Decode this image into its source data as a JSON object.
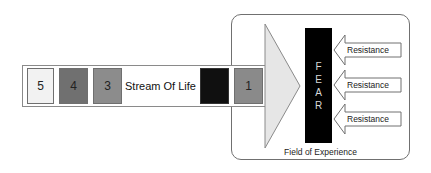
{
  "diagram": {
    "stream": {
      "label": "Stream Of Life",
      "segments": [
        {
          "label": "5",
          "fill": "#f2f2f2"
        },
        {
          "label": "4",
          "fill": "#707070"
        },
        {
          "label": "3",
          "fill": "#8c8c8c"
        },
        {
          "label": "",
          "fill": "#101010"
        },
        {
          "label": "1",
          "fill": "#8a8a8a"
        }
      ]
    },
    "fear": {
      "letters": [
        "F",
        "E",
        "A",
        "R"
      ],
      "fill": "#000000"
    },
    "resistances": [
      {
        "label": "Resistance"
      },
      {
        "label": "Resistance"
      },
      {
        "label": "Resistance"
      }
    ],
    "field": {
      "label": "Field of Experience"
    },
    "big_arrow": {
      "fill": "#e6e6e6"
    }
  }
}
